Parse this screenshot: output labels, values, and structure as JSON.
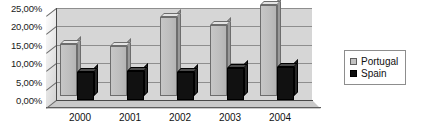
{
  "chart_data": {
    "type": "bar",
    "title": "",
    "subtitle": "",
    "xlabel": "",
    "ylabel": "",
    "categories": [
      "2000",
      "2001",
      "2002",
      "2003",
      "2004"
    ],
    "series": [
      {
        "name": "Portugal",
        "color": "#c2c2c2",
        "values": [
          14.0,
          13.7,
          21.5,
          19.3,
          24.8
        ]
      },
      {
        "name": "Spain",
        "color": "#0e0e0e",
        "values": [
          7.5,
          8.0,
          7.6,
          8.6,
          9.0
        ]
      }
    ],
    "ylim": [
      0,
      25
    ],
    "ytick_values": [
      0,
      5,
      10,
      15,
      20,
      25
    ],
    "ytick_labels": [
      "0,00%",
      "5,00%",
      "10,00%",
      "15,00%",
      "20,00%",
      "25,00%"
    ],
    "grid": true,
    "legend_position": "right",
    "style": "3d-column"
  },
  "legend": {
    "entries": [
      {
        "label": "Portugal",
        "swatch": "light-gray-square"
      },
      {
        "label": "Spain",
        "swatch": "black-square"
      }
    ]
  },
  "colors": {
    "plot_background": "#d6d6d6",
    "gridline": "#8e8e8e",
    "axis": "#4a4a4a",
    "portugal": "#c2c2c2",
    "spain": "#0e0e0e",
    "text": "#111111",
    "page_background": "#ffffff"
  }
}
